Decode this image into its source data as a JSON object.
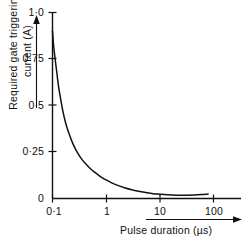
{
  "chart_data": {
    "type": "line",
    "title": "",
    "subtitle": "",
    "xlabel": "Pulse duration (µs)",
    "ylabel_lines": [
      "Required gate triggering",
      "current (A)"
    ],
    "ylabel": "Required gate triggering current (A)",
    "xscale": "log",
    "yscale": "linear",
    "xlim": [
      0.1,
      200
    ],
    "ylim": [
      0,
      1.0
    ],
    "grid": false,
    "legend": null,
    "x_ticks": [
      {
        "value": 0.1,
        "label": "0·1"
      },
      {
        "value": 1,
        "label": "1"
      },
      {
        "value": 10,
        "label": "10"
      },
      {
        "value": 100,
        "label": "100"
      }
    ],
    "y_ticks": [
      {
        "value": 1.0,
        "label": "1·0"
      },
      {
        "value": 0.75,
        "label": "0·75"
      },
      {
        "value": 0.5,
        "label": "0·5"
      },
      {
        "value": 0.25,
        "label": "0·25"
      },
      {
        "value": 0,
        "label": "0"
      }
    ],
    "series": [
      {
        "name": "Required gate triggering current",
        "color": "#111111",
        "x": [
          0.1,
          0.105,
          0.112,
          0.12,
          0.13,
          0.145,
          0.16,
          0.18,
          0.2,
          0.24,
          0.29,
          0.35,
          0.42,
          0.5,
          0.6,
          0.75,
          0.9,
          1.0,
          1.3,
          1.7,
          2.2,
          3.0,
          4.0,
          5.5,
          7.5,
          10,
          14,
          20,
          30,
          45,
          60,
          80
        ],
        "y": [
          0.9,
          0.82,
          0.75,
          0.68,
          0.6,
          0.52,
          0.455,
          0.395,
          0.355,
          0.295,
          0.248,
          0.212,
          0.185,
          0.163,
          0.143,
          0.122,
          0.107,
          0.1,
          0.083,
          0.069,
          0.058,
          0.047,
          0.039,
          0.032,
          0.026,
          0.023,
          0.02,
          0.018,
          0.018,
          0.019,
          0.021,
          0.024
        ]
      }
    ],
    "annotations": []
  },
  "axis_arrows": {
    "y_arrow": "up-arrow-icon",
    "x_arrow": "right-arrow-icon"
  },
  "colors": {
    "axis": "#111111",
    "curve": "#111111",
    "background": "#ffffff",
    "text": "#111111"
  }
}
